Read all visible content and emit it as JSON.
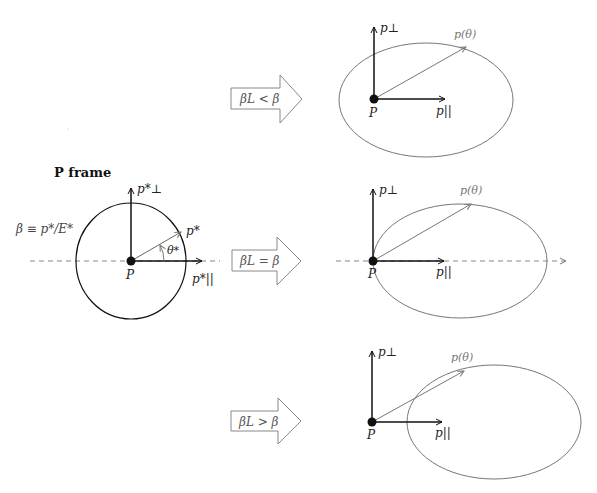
{
  "title": "P frame",
  "beta_definition": "β ≡ p*/E*",
  "rest_frame": {
    "point_label": "P",
    "perp_axis_label": "p*⊥",
    "par_axis_label": "p*||",
    "momentum_label": "p*",
    "angle_label": "θ*"
  },
  "transitions": [
    {
      "condition": "βL < β"
    },
    {
      "condition": "βL = β"
    },
    {
      "condition": "βL > β"
    }
  ],
  "boosted_frames": [
    {
      "point_label": "P",
      "perp_axis_label": "p⊥",
      "par_axis_label": "p||",
      "momentum_label": "p(θ)"
    },
    {
      "point_label": "P",
      "perp_axis_label": "p⊥",
      "par_axis_label": "p||",
      "momentum_label": "p(θ)"
    },
    {
      "point_label": "P",
      "perp_axis_label": "p⊥",
      "par_axis_label": "p||",
      "momentum_label": "p(θ)"
    }
  ],
  "colors": {
    "black": "#111111",
    "gray": "#777777",
    "dashed": "#888888"
  }
}
